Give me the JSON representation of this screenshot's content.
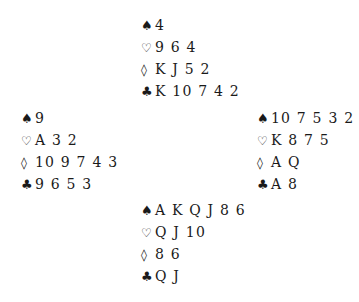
{
  "deal": {
    "north": {
      "spades": "4",
      "hearts": "9 6 4",
      "diamonds": "K J 5 2",
      "clubs": "K 10 7 4 2"
    },
    "west": {
      "spades": "9",
      "hearts": "A 3 2",
      "diamonds": "10 9 7 4 3",
      "clubs": "9 6 5 3"
    },
    "east": {
      "spades": "10 7 5 3 2",
      "hearts": "K 8 7 5",
      "diamonds": "A Q",
      "clubs": "A 8"
    },
    "south": {
      "spades": "A K Q J 8 6",
      "hearts": "Q J 10",
      "diamonds": "8 6",
      "clubs": "Q J"
    }
  },
  "suit_symbols": {
    "spades": "♠",
    "hearts": "♡",
    "diamonds": "◊",
    "clubs": "♣"
  }
}
